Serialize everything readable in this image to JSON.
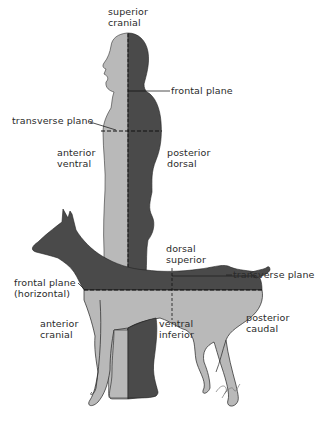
{
  "colors": {
    "light": "#b9b9b9",
    "dark": "#4a4a4a",
    "outline": "#222222",
    "text": "#2a2a2a",
    "background": "#ffffff"
  },
  "human": {
    "top_label": [
      "superior",
      "cranial"
    ],
    "front_label": [
      "anterior",
      "ventral"
    ],
    "back_label": [
      "posterior",
      "dorsal"
    ],
    "frontal_plane": "frontal plane",
    "transverse_plane": "transverse plane"
  },
  "dog": {
    "top_label": [
      "dorsal",
      "superior"
    ],
    "transverse_plane": "transverse plane",
    "frontal_plane": [
      "frontal plane",
      "(horizontal)"
    ],
    "front_label": [
      "anterior",
      "cranial"
    ],
    "bottom_label": [
      "ventral",
      "inferior"
    ],
    "back_label": [
      "posterior",
      "caudal"
    ]
  },
  "signature": "signature"
}
